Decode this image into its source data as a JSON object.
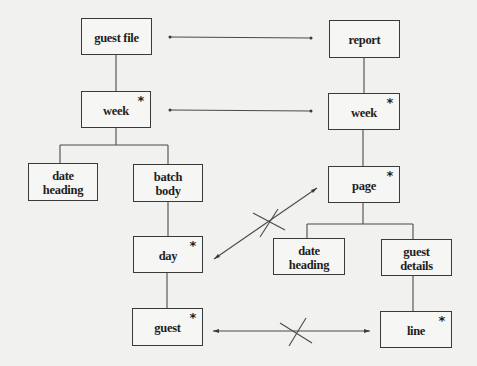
{
  "diagram": {
    "type": "Jackson structure diagram correspondence",
    "left_tree": {
      "root": {
        "label": "guest file",
        "iterated": false
      },
      "nodes": [
        {
          "id": "guest_file",
          "label": "guest file",
          "iterated": false,
          "star": ""
        },
        {
          "id": "week_l",
          "label": "week",
          "iterated": true,
          "star": "*"
        },
        {
          "id": "date_heading_l",
          "label": "date\nheading",
          "iterated": false,
          "star": ""
        },
        {
          "id": "batch_body",
          "label": "batch\nbody",
          "iterated": false,
          "star": ""
        },
        {
          "id": "day",
          "label": "day",
          "iterated": true,
          "star": "*"
        },
        {
          "id": "guest",
          "label": "guest",
          "iterated": true,
          "star": "*"
        }
      ]
    },
    "right_tree": {
      "nodes": [
        {
          "id": "report",
          "label": "report",
          "iterated": false,
          "star": ""
        },
        {
          "id": "week_r",
          "label": "week",
          "iterated": true,
          "star": "*"
        },
        {
          "id": "page",
          "label": "page",
          "iterated": true,
          "star": "*"
        },
        {
          "id": "date_heading_r",
          "label": "date\nheading",
          "iterated": false,
          "star": ""
        },
        {
          "id": "guest_details",
          "label": "guest\ndetails",
          "iterated": false,
          "star": ""
        },
        {
          "id": "line",
          "label": "line",
          "iterated": true,
          "star": "*"
        }
      ]
    },
    "correspondences": [
      {
        "from": "guest file",
        "to": "report",
        "status": "valid"
      },
      {
        "from": "week",
        "to": "week",
        "status": "valid"
      },
      {
        "from": "day",
        "to": "page",
        "status": "crossed-out"
      },
      {
        "from": "guest",
        "to": "line",
        "status": "crossed-out"
      }
    ],
    "colors": {
      "line": "#3a3a3a",
      "background": "#f1f1ef",
      "text": "#1e1e1e"
    }
  }
}
